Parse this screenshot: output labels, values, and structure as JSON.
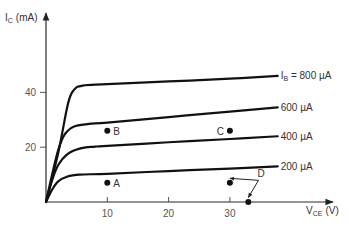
{
  "chart_data": {
    "type": "line",
    "title": "",
    "xlabel": "V_CE (V)",
    "ylabel": "I_C (mA)",
    "x_axis": {
      "label_main": "V",
      "label_sub": "CE",
      "label_unit": "(V)",
      "ticks": [
        10,
        20,
        30
      ],
      "range": [
        0,
        47
      ]
    },
    "y_axis": {
      "label_main": "I",
      "label_sub": "C",
      "label_unit": "(mA)",
      "ticks": [
        20,
        40
      ],
      "range": [
        0,
        70
      ]
    },
    "grid": false,
    "legend": "inline labels at right end of curves",
    "series": [
      {
        "name": "I_B = 800 µA",
        "label_prefix": "I",
        "label_sub": "B",
        "label_text": " = 800 µA",
        "points": [
          [
            0,
            0
          ],
          [
            2,
            18
          ],
          [
            3.6,
            36
          ],
          [
            4.6,
            41
          ],
          [
            6,
            42.5
          ],
          [
            10,
            43
          ],
          [
            20,
            44
          ],
          [
            30,
            45
          ],
          [
            37.8,
            46
          ]
        ]
      },
      {
        "name": "600 µA",
        "label_text": "600 µA",
        "points": [
          [
            0,
            0
          ],
          [
            1,
            10
          ],
          [
            2,
            19
          ],
          [
            3,
            24.5
          ],
          [
            4.5,
            27.5
          ],
          [
            7,
            28.5
          ],
          [
            10,
            29
          ],
          [
            20,
            31
          ],
          [
            30,
            33
          ],
          [
            37.8,
            34.5
          ]
        ]
      },
      {
        "name": "400 µA",
        "label_text": "400 µA",
        "points": [
          [
            0,
            0
          ],
          [
            1,
            8
          ],
          [
            2,
            13.5
          ],
          [
            3.5,
            17.5
          ],
          [
            5.5,
            19.5
          ],
          [
            8,
            20.2
          ],
          [
            10,
            20.5
          ],
          [
            20,
            21.8
          ],
          [
            30,
            23
          ],
          [
            37.8,
            24
          ]
        ]
      },
      {
        "name": "200 µA",
        "label_text": "200 µA",
        "points": [
          [
            0,
            0
          ],
          [
            1,
            4.5
          ],
          [
            2,
            7.5
          ],
          [
            3.5,
            9.3
          ],
          [
            5.5,
            10
          ],
          [
            10,
            10.3
          ],
          [
            20,
            11.3
          ],
          [
            30,
            12.2
          ],
          [
            37.8,
            13
          ]
        ]
      }
    ],
    "points": [
      {
        "name": "A",
        "x": 10,
        "y": 7,
        "label": "A",
        "label_side": "right"
      },
      {
        "name": "B",
        "x": 10,
        "y": 26,
        "label": "B",
        "label_side": "right"
      },
      {
        "name": "C",
        "x": 30,
        "y": 26,
        "label": "C",
        "label_side": "left"
      },
      {
        "name": "D1",
        "x": 30,
        "y": 7,
        "label": "",
        "label_side": "none"
      },
      {
        "name": "D2",
        "x": 33,
        "y": 0,
        "label": "",
        "label_side": "none"
      }
    ],
    "annotations": [
      {
        "text": "D",
        "x": 34.5,
        "y": 9,
        "arrows_to": [
          "D1",
          "D2"
        ]
      }
    ]
  },
  "colors": {
    "ink": "#111111",
    "axis": "#2a2a2a",
    "text": "#333333",
    "background": "#ffffff"
  }
}
